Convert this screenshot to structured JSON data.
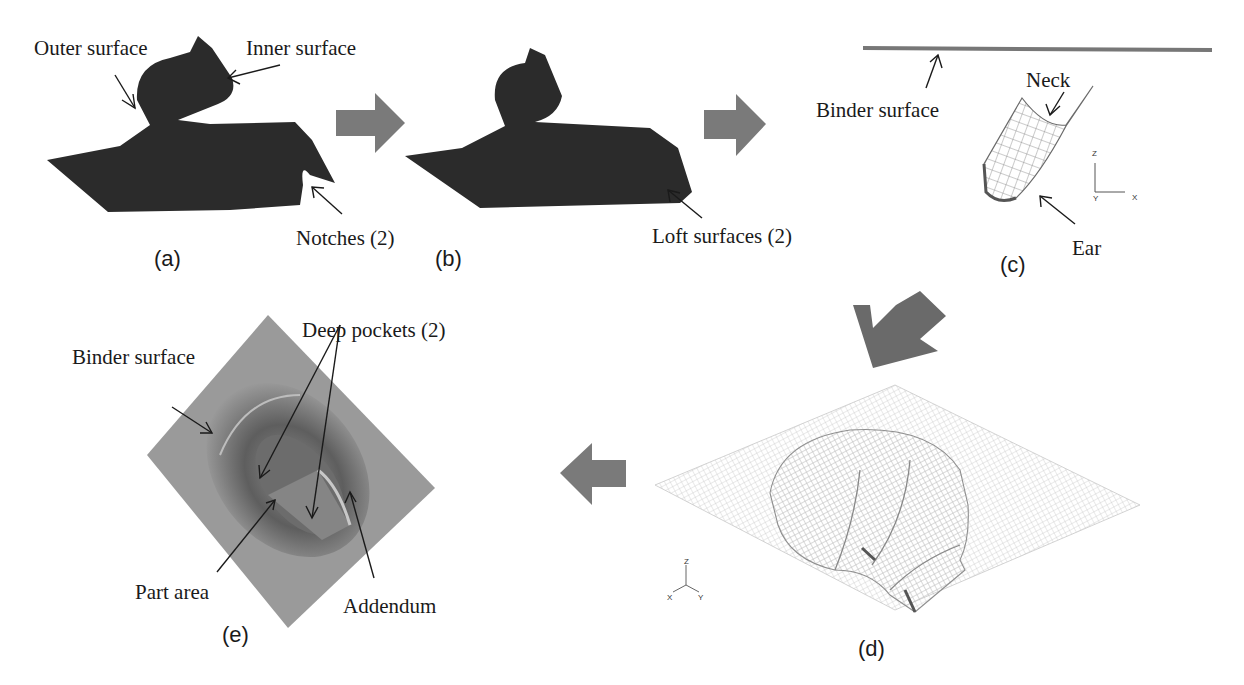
{
  "figure": {
    "panels": [
      {
        "id": "a",
        "caption": "(a)",
        "annotations": [
          "Outer surface",
          "Inner surface",
          "Notches (2)"
        ]
      },
      {
        "id": "b",
        "caption": "(b)",
        "annotations": [
          "Loft surfaces (2)"
        ]
      },
      {
        "id": "c",
        "caption": "(c)",
        "annotations": [
          "Binder surface",
          "Neck",
          "Ear"
        ],
        "axes": {
          "vertical": "Z",
          "horizontal": "X",
          "origin": "Y"
        }
      },
      {
        "id": "d",
        "caption": "(d)",
        "annotations": [],
        "axes": {
          "up": "Z",
          "left": "X",
          "right": "Y"
        }
      },
      {
        "id": "e",
        "caption": "(e)",
        "annotations": [
          "Binder surface",
          "Deep pockets (2)",
          "Part area",
          "Addendum"
        ]
      }
    ],
    "flow_arrows": [
      "a-to-b",
      "b-to-c",
      "c-to-d",
      "d-to-e"
    ],
    "colors": {
      "solid_part": "#2b2b2b",
      "arrow": "#7a7a7a",
      "binder_plate": "#9a9a9a",
      "mesh": "#8c8c8c"
    }
  }
}
